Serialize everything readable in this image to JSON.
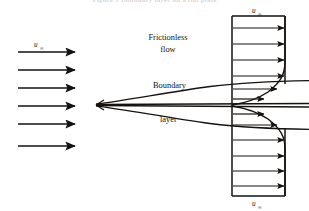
{
  "figure": {
    "caption_fragment": "Figure 1  Boundary layer on a flat plate",
    "colors": {
      "ink": "#15120f",
      "background": "#ffffff",
      "caption_ghost": "#b9b9b9"
    },
    "labels": {
      "frictionless_line1": "Frictionless",
      "frictionless_line2": "flow",
      "boundary": "Boundary",
      "layer": "layer",
      "u_symbol": "u",
      "u_subscript": "∞"
    },
    "freestream_arrows": {
      "name": "uniform-approach-flow-arrows",
      "count": 6,
      "label": "u",
      "label_subscript": "∞",
      "x_start": 18,
      "x_end": 75,
      "y_values": [
        52,
        70,
        88,
        106,
        124,
        142
      ]
    },
    "plate": {
      "name": "flat-plate",
      "leading_edge_x": 96,
      "trailing_edge_x": 309,
      "y": 105
    },
    "boundary_layer_envelope": {
      "name": "boundary-layer-edge-curves",
      "description": "lens-shaped envelope growing from leading edge",
      "upper_curve_end_y": 84,
      "lower_curve_end_y": 126
    },
    "profile_stations": [
      {
        "name": "upper-freestream-profile",
        "region": "frictionless",
        "arrow_y_values": [
          22,
          38,
          54,
          70
        ],
        "x_axis": 232,
        "x_tip": 285,
        "uniform": true
      },
      {
        "name": "upper-boundary-layer-profile",
        "region": "boundary-layer",
        "arrow_y_values": [
          86,
          96
        ],
        "x_axis": 232,
        "uniform": false
      },
      {
        "name": "lower-boundary-layer-profile",
        "region": "boundary-layer",
        "arrow_y_values": [
          116,
          126
        ],
        "x_axis": 232,
        "uniform": false
      },
      {
        "name": "lower-freestream-profile",
        "region": "frictionless",
        "arrow_y_values": [
          142,
          158,
          174,
          188
        ],
        "x_axis": 232,
        "x_tip": 285,
        "uniform": true
      }
    ],
    "top_profile_label": {
      "name": "top-velocity-label",
      "x": 256,
      "y": 13
    },
    "bottom_profile_label": {
      "name": "bottom-velocity-label",
      "x": 256,
      "y": 202
    }
  }
}
